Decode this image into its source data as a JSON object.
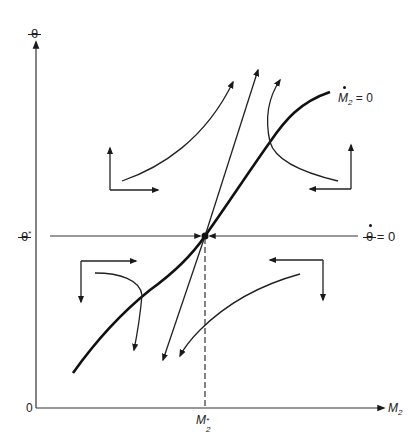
{
  "diagram": {
    "type": "phase-diagram",
    "colors": {
      "background": "#ffffff",
      "ink": "#1a1a1a"
    },
    "axes": {
      "y_label": "θ",
      "x_label_base": "M",
      "x_label_sub": "2",
      "origin_label": "0"
    },
    "equilibrium": {
      "theta_star_label": "θ",
      "theta_star_sup": "*",
      "m2_star_base": "M",
      "m2_star_sub": "2",
      "m2_star_sup": "*"
    },
    "loci": {
      "theta_dot_zero": {
        "symbol": "θ",
        "equals": "= 0"
      },
      "m2_dot_zero": {
        "symbol": "M",
        "sub": "2",
        "equals": "= 0"
      }
    },
    "quadrant_arrows": [
      {
        "quadrant": "upper-left",
        "directions": [
          "up",
          "right"
        ]
      },
      {
        "quadrant": "upper-right",
        "directions": [
          "up",
          "left"
        ]
      },
      {
        "quadrant": "lower-left",
        "directions": [
          "down",
          "right"
        ]
      },
      {
        "quadrant": "lower-right",
        "directions": [
          "down",
          "left"
        ]
      }
    ],
    "trajectories": [
      "upper-left curve heading up-right",
      "steep saddle path through equilibrium (up-right and down-left)",
      "upper-right curve crossing M2-dot locus heading up",
      "lower-left curve crossing M2-dot locus heading down",
      "lower-right curve heading down-left"
    ]
  }
}
